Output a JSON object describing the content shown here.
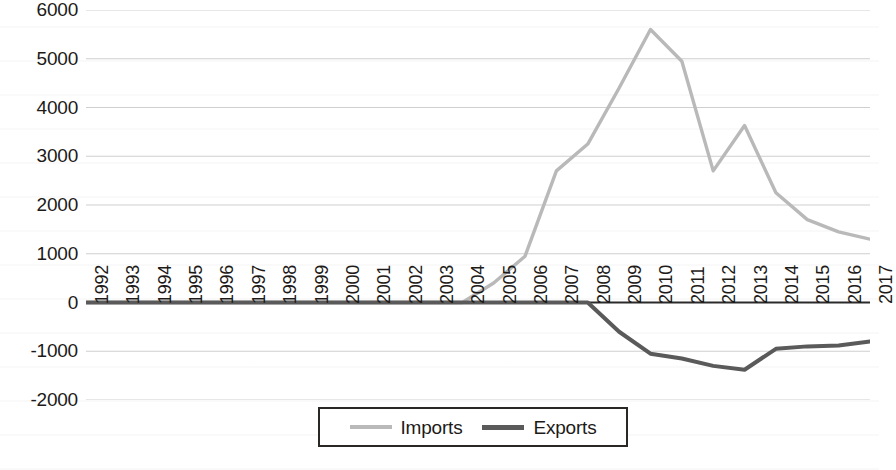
{
  "chart_data": {
    "type": "line",
    "title": "",
    "xlabel": "",
    "ylabel": "",
    "grid": true,
    "legend_position": "bottom",
    "ylim": [
      -2000,
      6000
    ],
    "y_ticks": [
      6000,
      5000,
      4000,
      3000,
      2000,
      1000,
      0,
      -1000,
      -2000
    ],
    "y_tick_labels": [
      "6000",
      "5000",
      "4000",
      "3000",
      "2000",
      "1000",
      "0",
      "-1000",
      "-2000"
    ],
    "categories": [
      "1992",
      "1993",
      "1994",
      "1995",
      "1996",
      "1997",
      "1998",
      "1999",
      "2000",
      "2001",
      "2002",
      "2003",
      "2004",
      "2005",
      "2006",
      "2007",
      "2008",
      "2009",
      "2010",
      "2011",
      "2012",
      "2013",
      "2014",
      "2015",
      "2016",
      "2017"
    ],
    "series": [
      {
        "name": "Imports",
        "color": "#b9b9b9",
        "values": [
          0,
          0,
          0,
          0,
          0,
          0,
          0,
          0,
          0,
          0,
          0,
          0,
          0,
          400,
          950,
          2700,
          3250,
          4400,
          5600,
          4950,
          2700,
          3630,
          2250,
          1700,
          1450,
          1300
        ]
      },
      {
        "name": "Exports",
        "color": "#5a5a5a",
        "values": [
          0,
          0,
          0,
          0,
          0,
          0,
          0,
          0,
          0,
          0,
          0,
          0,
          0,
          0,
          0,
          0,
          0,
          -600,
          -1050,
          -1150,
          -1300,
          -1380,
          -950,
          -900,
          -880,
          -800
        ]
      }
    ]
  },
  "legend": {
    "entries": [
      {
        "label": "Imports",
        "swatch": "imports-line-swatch"
      },
      {
        "label": "Exports",
        "swatch": "exports-line-swatch"
      }
    ]
  }
}
